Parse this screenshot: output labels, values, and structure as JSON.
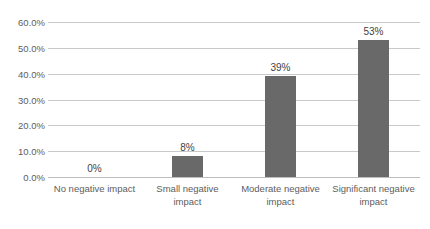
{
  "chart_data": {
    "type": "bar",
    "title": "",
    "xlabel": "",
    "ylabel": "",
    "categories": [
      "No negative impact",
      "Small negative impact",
      "Moderate negative impact",
      "Significant negative impact"
    ],
    "values": [
      0,
      8,
      39,
      53
    ],
    "data_labels": [
      "0%",
      "8%",
      "39%",
      "53%"
    ],
    "ylim": [
      0,
      60
    ],
    "ytick_labels": [
      "60.0%",
      "50.0%",
      "40.0%",
      "30.0%",
      "20.0%",
      "10.0%",
      "0.0%"
    ],
    "ytick_values": [
      60,
      50,
      40,
      30,
      20,
      10,
      0
    ],
    "grid": true,
    "legend": false,
    "bar_color": "#696969",
    "gridline_color": "#c9c9c9",
    "axis_text_color": "#5d5d5d",
    "data_label_color": "#3f3f3f",
    "background_color": "#ffffff"
  }
}
